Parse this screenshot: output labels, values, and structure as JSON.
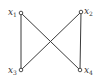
{
  "diagram": {
    "type": "graph",
    "colors": {
      "edge": "#3a3a3a",
      "node_stroke": "#3a3a3a",
      "node_fill": "#ffffff",
      "label": "#333333"
    },
    "nodes": [
      {
        "id": "x1",
        "base": "x",
        "sub": "1",
        "cx": 21,
        "cy": 13,
        "label_x": 8,
        "label_y": 8
      },
      {
        "id": "x2",
        "base": "x",
        "sub": "2",
        "cx": 81,
        "cy": 12,
        "label_x": 84,
        "label_y": 7
      },
      {
        "id": "x3",
        "base": "x",
        "sub": "3",
        "cx": 21,
        "cy": 70,
        "label_x": 8,
        "label_y": 66
      },
      {
        "id": "x4",
        "base": "x",
        "sub": "4",
        "cx": 80,
        "cy": 70,
        "label_x": 84,
        "label_y": 66
      }
    ],
    "edges": [
      {
        "from": "x1",
        "to": "x3"
      },
      {
        "from": "x2",
        "to": "x4"
      },
      {
        "from": "x1",
        "to": "x4"
      },
      {
        "from": "x2",
        "to": "x3"
      }
    ]
  }
}
